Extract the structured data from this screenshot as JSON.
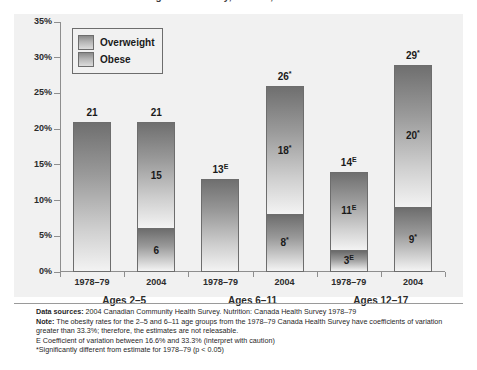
{
  "title": "Overweight and obesity, Canada, 1978–79 and 2004",
  "legend": {
    "items": [
      {
        "label": "Overweight",
        "key": "overweight"
      },
      {
        "label": "Obese",
        "key": "obese"
      }
    ]
  },
  "axis": {
    "yticks": [
      "0%",
      "5%",
      "10%",
      "15%",
      "20%",
      "25%",
      "30%",
      "35%"
    ]
  },
  "groups": [
    {
      "label": "Ages 2–5"
    },
    {
      "label": "Ages 6–11"
    },
    {
      "label": "Ages 12–17"
    }
  ],
  "years": [
    "1978–79",
    "2004",
    "1978–79",
    "2004",
    "1978–79",
    "2004"
  ],
  "notes": {
    "sources_label": "Data sources:",
    "sources_text": " 2004 Canadian Community Health Survey. Nutrition: Canada Health Survey 1978–79",
    "note_label": "Note:",
    "note_text": " The obesity rates for the 2–5 and 6–11 age groups from the 1978–79 Canada Health Survey have coefficients of variation greater than 33.3%; therefore, the estimates are not releasable.",
    "e_note": "E Coefficient of variation between 16.6% and 33.3% (interpret with caution)",
    "star_note": "*Significantly different from estimate for 1978–79 (p < 0.05)"
  },
  "colors": {
    "panel_bg": "#f1f1f1",
    "bar_dark": "#6f6f6f",
    "bar_light": "#f3f3f3",
    "axis": "#8e8e8e",
    "text": "#1a1a1a"
  },
  "chart_data": {
    "type": "bar",
    "title": "Overweight and obesity, Canada, 1978–79 and 2004",
    "xlabel": "",
    "ylabel": "",
    "ylim": [
      0,
      35
    ],
    "ytick_values": [
      0,
      5,
      10,
      15,
      20,
      25,
      30,
      35
    ],
    "grid": false,
    "legend_position": "top-left-inside",
    "stacked": true,
    "categories": [
      "Ages 2–5 / 1978–79",
      "Ages 2–5 / 2004",
      "Ages 6–11 / 1978–79",
      "Ages 6–11 / 2004",
      "Ages 12–17 / 1978–79",
      "Ages 12–17 / 2004"
    ],
    "series": [
      {
        "name": "Obese",
        "values": [
          null,
          6,
          null,
          8,
          3,
          9
        ]
      },
      {
        "name": "Overweight",
        "values": [
          null,
          15,
          null,
          18,
          11,
          20
        ]
      }
    ],
    "totals": [
      21,
      21,
      13,
      26,
      14,
      29
    ],
    "bars": [
      {
        "group": "Ages 2–5",
        "year": "1978–79",
        "total": 21,
        "total_label": "21",
        "total_marker": "",
        "segments": [
          {
            "name": "Overweight",
            "value": 21,
            "label": "",
            "marker": "",
            "split": false
          }
        ]
      },
      {
        "group": "Ages 2–5",
        "year": "2004",
        "total": 21,
        "total_label": "21",
        "total_marker": "",
        "segments": [
          {
            "name": "Overweight",
            "value": 15,
            "label": "15",
            "marker": "",
            "split": true
          },
          {
            "name": "Obese",
            "value": 6,
            "label": "6",
            "marker": "",
            "split": true
          }
        ]
      },
      {
        "group": "Ages 6–11",
        "year": "1978–79",
        "total": 13,
        "total_label": "13",
        "total_marker": "E",
        "segments": [
          {
            "name": "Overweight",
            "value": 13,
            "label": "",
            "marker": "",
            "split": false
          }
        ]
      },
      {
        "group": "Ages 6–11",
        "year": "2004",
        "total": 26,
        "total_label": "26",
        "total_marker": "*",
        "segments": [
          {
            "name": "Overweight",
            "value": 18,
            "label": "18",
            "marker": "*",
            "split": true
          },
          {
            "name": "Obese",
            "value": 8,
            "label": "8",
            "marker": "*",
            "split": true
          }
        ]
      },
      {
        "group": "Ages 12–17",
        "year": "1978–79",
        "total": 14,
        "total_label": "14",
        "total_marker": "E",
        "segments": [
          {
            "name": "Overweight",
            "value": 11,
            "label": "11",
            "marker": "E",
            "split": true
          },
          {
            "name": "Obese",
            "value": 3,
            "label": "3",
            "marker": "E",
            "split": true
          }
        ]
      },
      {
        "group": "Ages 12–17",
        "year": "2004",
        "total": 29,
        "total_label": "29",
        "total_marker": "*",
        "segments": [
          {
            "name": "Overweight",
            "value": 20,
            "label": "20",
            "marker": "*",
            "split": true
          },
          {
            "name": "Obese",
            "value": 9,
            "label": "9",
            "marker": "*",
            "split": true
          }
        ]
      }
    ]
  }
}
